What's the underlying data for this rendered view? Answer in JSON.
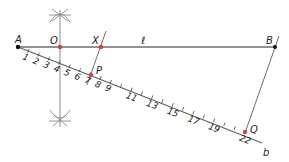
{
  "diagram": {
    "type": "geometric-construction",
    "colors": {
      "line": "#6e6e6e",
      "point_red": "#d9412b",
      "point_black": "#111111",
      "text": "#222222"
    },
    "points": {
      "A": {
        "label": "A",
        "x": 18,
        "y": 47
      },
      "O": {
        "label": "O",
        "x": 60,
        "y": 47
      },
      "X": {
        "label": "X",
        "x": 101,
        "y": 47
      },
      "B": {
        "label": "B",
        "x": 275,
        "y": 47
      },
      "P": {
        "label": "P",
        "x": 91,
        "y": 75
      },
      "Q": {
        "label": "Q",
        "x": 245,
        "y": 132
      }
    },
    "line_label": "ℓ",
    "ray_label": "b",
    "tick_labels": [
      "1",
      "2",
      "3",
      "4",
      "5",
      "6",
      "7",
      "8",
      "9",
      "11",
      "13",
      "15",
      "17",
      "19",
      "22"
    ]
  }
}
